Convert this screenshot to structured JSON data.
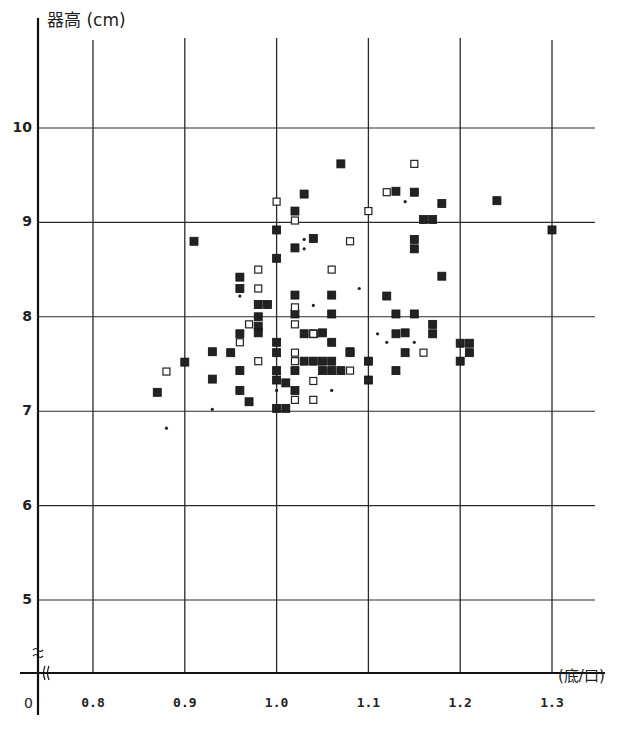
{
  "chart_data": {
    "type": "scatter",
    "title": "",
    "xlabel": "(底/口)",
    "ylabel": "器高 (cm)",
    "origin_label": "0",
    "axis_break_symbol": "≈",
    "xlim": [
      0.8,
      1.3
    ],
    "ylim": [
      5,
      10
    ],
    "x_ticks": [
      "0.8",
      "0.9",
      "1.0",
      "1.1",
      "1.2",
      "1.3"
    ],
    "y_ticks": [
      "5",
      "6",
      "7",
      "8",
      "9",
      "10"
    ],
    "grid": true,
    "legend": null,
    "series": [
      {
        "name": "filled square",
        "marker": "filled-square",
        "color": "#1a1a1a",
        "points": [
          [
            0.87,
            7.2
          ],
          [
            0.9,
            7.52
          ],
          [
            0.91,
            8.8
          ],
          [
            0.93,
            7.63
          ],
          [
            0.93,
            7.34
          ],
          [
            0.95,
            7.62
          ],
          [
            0.96,
            8.42
          ],
          [
            0.96,
            8.3
          ],
          [
            0.96,
            7.82
          ],
          [
            0.96,
            7.43
          ],
          [
            0.96,
            7.22
          ],
          [
            0.97,
            7.1
          ],
          [
            0.98,
            8.13
          ],
          [
            0.98,
            8.0
          ],
          [
            0.98,
            7.9
          ],
          [
            0.98,
            7.83
          ],
          [
            0.99,
            8.13
          ],
          [
            1.0,
            8.92
          ],
          [
            1.0,
            8.62
          ],
          [
            1.0,
            7.73
          ],
          [
            1.0,
            7.62
          ],
          [
            1.0,
            7.43
          ],
          [
            1.0,
            7.33
          ],
          [
            1.0,
            7.03
          ],
          [
            1.01,
            7.03
          ],
          [
            1.01,
            7.3
          ],
          [
            1.02,
            9.12
          ],
          [
            1.02,
            8.73
          ],
          [
            1.02,
            8.23
          ],
          [
            1.02,
            8.03
          ],
          [
            1.02,
            7.43
          ],
          [
            1.02,
            7.22
          ],
          [
            1.03,
            9.3
          ],
          [
            1.03,
            7.82
          ],
          [
            1.03,
            7.53
          ],
          [
            1.04,
            8.83
          ],
          [
            1.04,
            7.82
          ],
          [
            1.04,
            7.53
          ],
          [
            1.05,
            7.53
          ],
          [
            1.05,
            7.43
          ],
          [
            1.05,
            7.83
          ],
          [
            1.06,
            7.73
          ],
          [
            1.06,
            7.53
          ],
          [
            1.06,
            7.43
          ],
          [
            1.06,
            8.23
          ],
          [
            1.06,
            8.03
          ],
          [
            1.07,
            9.62
          ],
          [
            1.07,
            7.43
          ],
          [
            1.08,
            7.63
          ],
          [
            1.08,
            7.62
          ],
          [
            1.1,
            7.53
          ],
          [
            1.1,
            7.33
          ],
          [
            1.12,
            8.22
          ],
          [
            1.13,
            9.33
          ],
          [
            1.13,
            8.03
          ],
          [
            1.13,
            7.82
          ],
          [
            1.13,
            7.43
          ],
          [
            1.14,
            7.62
          ],
          [
            1.14,
            7.83
          ],
          [
            1.15,
            9.32
          ],
          [
            1.15,
            8.82
          ],
          [
            1.15,
            8.72
          ],
          [
            1.15,
            8.03
          ],
          [
            1.16,
            9.03
          ],
          [
            1.17,
            9.03
          ],
          [
            1.17,
            7.92
          ],
          [
            1.17,
            7.82
          ],
          [
            1.18,
            9.2
          ],
          [
            1.18,
            8.43
          ],
          [
            1.2,
            7.72
          ],
          [
            1.2,
            7.53
          ],
          [
            1.21,
            7.72
          ],
          [
            1.21,
            7.62
          ],
          [
            1.24,
            9.23
          ],
          [
            1.3,
            8.92
          ]
        ]
      },
      {
        "name": "open square",
        "marker": "open-square",
        "color": "#1a1a1a",
        "points": [
          [
            0.88,
            7.42
          ],
          [
            0.97,
            7.92
          ],
          [
            0.96,
            7.73
          ],
          [
            0.98,
            8.5
          ],
          [
            0.98,
            8.3
          ],
          [
            0.98,
            7.53
          ],
          [
            1.0,
            9.22
          ],
          [
            1.02,
            9.02
          ],
          [
            1.02,
            7.92
          ],
          [
            1.02,
            8.1
          ],
          [
            1.02,
            7.62
          ],
          [
            1.02,
            7.53
          ],
          [
            1.02,
            7.12
          ],
          [
            1.04,
            7.82
          ],
          [
            1.04,
            7.32
          ],
          [
            1.04,
            7.12
          ],
          [
            1.06,
            8.5
          ],
          [
            1.08,
            8.8
          ],
          [
            1.08,
            7.43
          ],
          [
            1.1,
            9.12
          ],
          [
            1.12,
            9.32
          ],
          [
            1.15,
            9.62
          ],
          [
            1.16,
            7.62
          ]
        ]
      },
      {
        "name": "dot",
        "marker": "small-dot",
        "color": "#1a1a1a",
        "points": [
          [
            0.88,
            6.82
          ],
          [
            0.93,
            7.02
          ],
          [
            0.96,
            8.22
          ],
          [
            1.0,
            7.22
          ],
          [
            1.03,
            8.82
          ],
          [
            1.03,
            8.72
          ],
          [
            1.04,
            8.12
          ],
          [
            1.06,
            7.22
          ],
          [
            1.09,
            8.3
          ],
          [
            1.11,
            7.82
          ],
          [
            1.12,
            7.73
          ],
          [
            1.14,
            9.22
          ],
          [
            1.15,
            7.73
          ]
        ]
      }
    ]
  }
}
